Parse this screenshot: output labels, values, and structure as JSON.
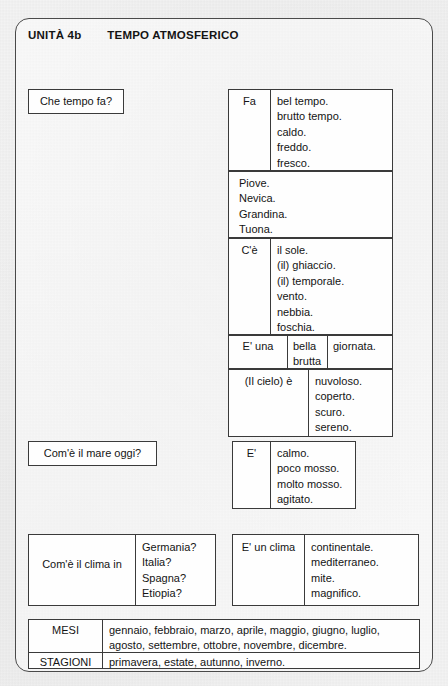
{
  "header": {
    "unit": "UNITÀ 4b",
    "title": "TEMPO ATMOSFERICO"
  },
  "weather": {
    "question": "Che tempo fa?",
    "fa": {
      "subject": "Fa",
      "items": [
        "bel tempo.",
        "brutto tempo.",
        "caldo.",
        "freddo.",
        "fresco."
      ]
    },
    "impersonal": {
      "items": [
        "Piove.",
        "Nevica.",
        "Grandina.",
        "Tuona."
      ]
    },
    "ce": {
      "subject": "C'è",
      "items": [
        "il sole.",
        "(il) ghiaccio.",
        "(il) temporale.",
        "vento.",
        "nebbia.",
        "foschia."
      ]
    },
    "euna": {
      "subject": "E' una",
      "adjectives": [
        "bella",
        "brutta"
      ],
      "noun": "giornata."
    },
    "cielo": {
      "subject": "(Il cielo) è",
      "items": [
        "nuvoloso.",
        "coperto.",
        "scuro.",
        "sereno."
      ]
    }
  },
  "sea": {
    "question": "Com'è il mare oggi?",
    "subject": "E'",
    "items": [
      "calmo.",
      "poco mosso.",
      "molto mosso.",
      "agitato."
    ]
  },
  "climate": {
    "question": "Com'è il clima in",
    "countries": [
      "Germania?",
      "Italia?",
      "Spagna?",
      "Etiopia?"
    ],
    "subject": "E' un clima",
    "items": [
      "continentale.",
      "mediterraneo.",
      "mite.",
      "magnifico."
    ]
  },
  "calendar": {
    "rows": [
      {
        "label": "MESI",
        "lines": [
          "gennaio, febbraio, marzo, aprile, maggio, giugno, luglio,",
          "agosto, settembre, ottobre, novembre, dicembre."
        ]
      },
      {
        "label": "STAGIONI",
        "lines": [
          "primavera, estate, autunno, inverno."
        ]
      }
    ]
  }
}
